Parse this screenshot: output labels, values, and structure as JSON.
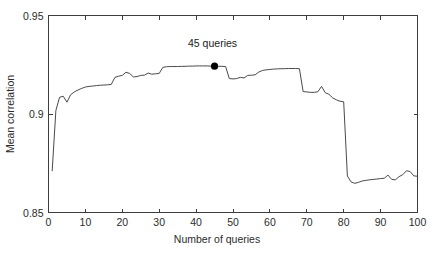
{
  "chart_data": {
    "type": "line",
    "title": "",
    "xlabel": "Number of queries",
    "ylabel": "Mean correlation",
    "xlim": [
      0,
      100
    ],
    "ylim": [
      0.85,
      0.95
    ],
    "xticks": [
      0,
      10,
      20,
      30,
      40,
      50,
      60,
      70,
      80,
      90,
      100
    ],
    "xticklabels": [
      "0",
      "10",
      "20",
      "30",
      "40",
      "50",
      "60",
      "70",
      "80",
      "90",
      "100"
    ],
    "yticks": [
      0.85,
      0.9,
      0.95
    ],
    "yticklabels": [
      "0.85",
      "0.9",
      "0.95"
    ],
    "grid": false,
    "legend": null,
    "line_color": "#4a4a4a",
    "axis_color": "#3d3d3d",
    "background": "#ffffff",
    "annotations": [
      {
        "text": "45 queries",
        "x": 45,
        "y": 0.9243,
        "marker": "filled-circle",
        "marker_color": "#000000",
        "label_dx": -2,
        "label_dy": 0.0075
      }
    ],
    "series": [
      {
        "name": "Mean correlation",
        "x": [
          1,
          2,
          3,
          4,
          5,
          6,
          7,
          8,
          9,
          10,
          11,
          12,
          13,
          14,
          15,
          16,
          17,
          18,
          19,
          20,
          21,
          22,
          23,
          24,
          25,
          26,
          27,
          28,
          29,
          30,
          31,
          32,
          33,
          34,
          35,
          36,
          37,
          38,
          39,
          40,
          41,
          42,
          43,
          44,
          45,
          46,
          47,
          48,
          49,
          50,
          51,
          52,
          53,
          54,
          55,
          56,
          57,
          58,
          59,
          60,
          61,
          62,
          63,
          64,
          65,
          66,
          67,
          68,
          69,
          70,
          71,
          72,
          73,
          74,
          75,
          76,
          77,
          78,
          79,
          80,
          81,
          82,
          83,
          84,
          85,
          86,
          87,
          88,
          89,
          90,
          91,
          92,
          93,
          94,
          95,
          96,
          97,
          98,
          99,
          100
        ],
        "y": [
          0.8712,
          0.9018,
          0.9085,
          0.909,
          0.906,
          0.9098,
          0.9112,
          0.9122,
          0.913,
          0.9137,
          0.914,
          0.9142,
          0.9144,
          0.9146,
          0.9147,
          0.9148,
          0.915,
          0.9186,
          0.9192,
          0.9196,
          0.9212,
          0.9206,
          0.9188,
          0.919,
          0.9196,
          0.9197,
          0.9208,
          0.9202,
          0.9204,
          0.9206,
          0.9237,
          0.924,
          0.9241,
          0.9241,
          0.9241,
          0.9242,
          0.9242,
          0.9243,
          0.9243,
          0.9244,
          0.9244,
          0.9244,
          0.9244,
          0.9243,
          0.9243,
          0.9242,
          0.9242,
          0.9241,
          0.918,
          0.9178,
          0.918,
          0.9186,
          0.9183,
          0.9196,
          0.9197,
          0.9199,
          0.9213,
          0.9221,
          0.9224,
          0.9226,
          0.9228,
          0.9229,
          0.923,
          0.923,
          0.9231,
          0.9231,
          0.9231,
          0.923,
          0.9114,
          0.9112,
          0.911,
          0.911,
          0.9113,
          0.914,
          0.9108,
          0.91,
          0.9082,
          0.9072,
          0.9065,
          0.9062,
          0.8685,
          0.8655,
          0.8648,
          0.8653,
          0.866,
          0.8663,
          0.8666,
          0.8668,
          0.867,
          0.8672,
          0.8674,
          0.869,
          0.8668,
          0.8666,
          0.8682,
          0.8692,
          0.8712,
          0.8708,
          0.8686,
          0.8684
        ]
      }
    ]
  }
}
